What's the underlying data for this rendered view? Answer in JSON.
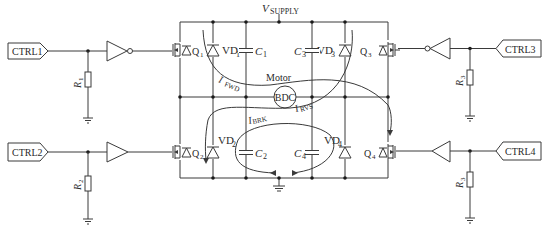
{
  "diagram": {
    "supply_label": "V",
    "supply_sub": "SUPPLY",
    "inputs": [
      {
        "id": "ctrl1",
        "label": "CTRL1",
        "side": "left",
        "buffer": "inverter"
      },
      {
        "id": "ctrl2",
        "label": "CTRL2",
        "side": "left",
        "buffer": "buffer"
      },
      {
        "id": "ctrl3",
        "label": "CTRL3",
        "side": "right",
        "buffer": "inverter"
      },
      {
        "id": "ctrl4",
        "label": "CTRL4",
        "side": "right",
        "buffer": "buffer"
      }
    ],
    "resistors": [
      {
        "label": "R",
        "sub": "1"
      },
      {
        "label": "R",
        "sub": "2"
      },
      {
        "label": "R",
        "sub": "3"
      },
      {
        "label": "R",
        "sub": "3"
      }
    ],
    "transistors": [
      {
        "label": "Q",
        "sub": "1"
      },
      {
        "label": "Q",
        "sub": "2"
      },
      {
        "label": "Q",
        "sub": "3"
      },
      {
        "label": "Q",
        "sub": "4"
      }
    ],
    "diodes": [
      {
        "label": "VD",
        "sub": "1"
      },
      {
        "label": "VD",
        "sub": "2"
      },
      {
        "label": "VD",
        "sub": "3"
      },
      {
        "label": "VD",
        "sub": "4"
      }
    ],
    "capacitors": [
      {
        "label": "C",
        "sub": "1"
      },
      {
        "label": "C",
        "sub": "2"
      },
      {
        "label": "C",
        "sub": "3"
      },
      {
        "label": "C",
        "sub": "4"
      }
    ],
    "motor": {
      "caption": "Motor",
      "symbol": "BDC"
    },
    "currents": [
      {
        "label": "I",
        "sub": "FWD"
      },
      {
        "label": "I",
        "sub": "RVS"
      },
      {
        "label": "I",
        "sub": "BRK"
      }
    ],
    "colors": {
      "line": "#3a3a3a",
      "text": "#2a2a2a",
      "background": "#ffffff"
    }
  }
}
